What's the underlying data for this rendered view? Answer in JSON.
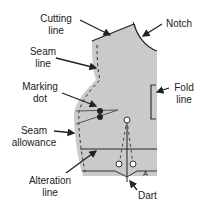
{
  "diagram": {
    "colors": {
      "fabric": "#cacaca",
      "line": "#222222",
      "alteration": "#7a7a7a"
    },
    "labels": {
      "cutting_line": [
        "Cutting",
        "line"
      ],
      "notch": [
        "Notch"
      ],
      "seam_line": [
        "Seam",
        "line"
      ],
      "marking_dot": [
        "Marking",
        "dot"
      ],
      "fold_line": [
        "Fold",
        "line"
      ],
      "seam_allowance": [
        "Seam",
        "allowance"
      ],
      "alteration_line": [
        "Alteration",
        "line"
      ],
      "dart": [
        "Dart"
      ]
    },
    "piece_letter": "A"
  }
}
